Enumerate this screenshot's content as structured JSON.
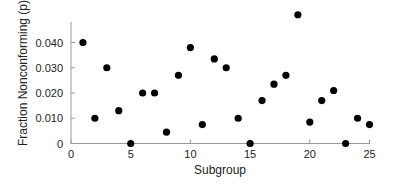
{
  "chart_data": {
    "type": "scatter",
    "title": "",
    "xlabel": "Subgroup",
    "ylabel": "Fraction Nonconforming (p)",
    "xlim": [
      0,
      25
    ],
    "ylim": [
      0,
      0.05
    ],
    "grid": false,
    "legend": null,
    "x_ticks": [
      0,
      5,
      10,
      15,
      20,
      25
    ],
    "x_tick_labels": [
      "0",
      "5",
      "10",
      "15",
      "20",
      "25"
    ],
    "y_ticks": [
      0,
      0.01,
      0.02,
      0.03,
      0.04
    ],
    "y_tick_labels": [
      "0",
      "0.010",
      "0.020",
      "0.030",
      "0.040"
    ],
    "x": [
      1,
      2,
      3,
      4,
      5,
      6,
      7,
      8,
      9,
      10,
      11,
      12,
      13,
      14,
      15,
      16,
      17,
      18,
      19,
      20,
      21,
      22,
      23,
      24,
      25
    ],
    "y": [
      0.04,
      0.01,
      0.03,
      0.013,
      0.0,
      0.02,
      0.02,
      0.0045,
      0.027,
      0.038,
      0.0075,
      0.0335,
      0.03,
      0.01,
      0.0,
      0.017,
      0.0235,
      0.027,
      0.051,
      0.0085,
      0.017,
      0.021,
      0.0,
      0.01,
      0.0075
    ],
    "marker_color": "#000000",
    "axis_color": "#999999"
  }
}
